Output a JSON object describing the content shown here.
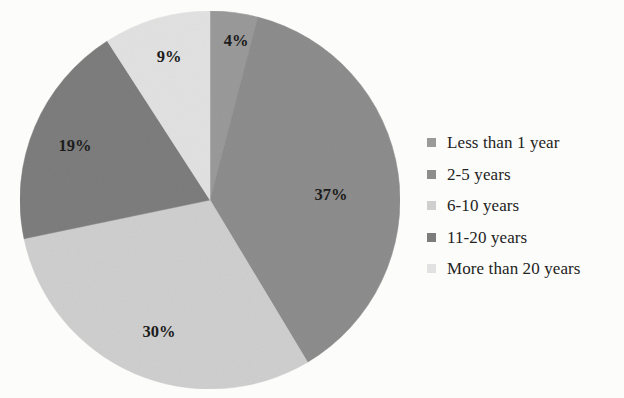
{
  "page": {
    "background_color": "#fcfcfa",
    "cropped_title_hint": ""
  },
  "chart_data": {
    "type": "pie",
    "title": "",
    "xlabel": "",
    "ylabel": "",
    "categories": [
      "Less than 1 year",
      "2-5 years",
      "6-10 years",
      "11-20 years",
      "More than 20 years"
    ],
    "values": [
      4,
      37,
      30,
      19,
      9
    ],
    "value_labels": [
      "4%",
      "37%",
      "30%",
      "19%",
      "9%"
    ],
    "units": "percent",
    "start_angle_deg": 0,
    "direction": "clockwise",
    "legend_position": "right",
    "grid": false,
    "colors": [
      "#9a9a9a",
      "#8d8d8d",
      "#cfcfcf",
      "#7d7d7d",
      "#e2e2e2"
    ],
    "slices": [
      {
        "label": "Less than 1 year",
        "value": 4,
        "display": "4%",
        "color": "#9a9a9a"
      },
      {
        "label": "2-5 years",
        "value": 37,
        "display": "37%",
        "color": "#8d8d8d"
      },
      {
        "label": "6-10 years",
        "value": 30,
        "display": "30%",
        "color": "#cfcfcf"
      },
      {
        "label": "11-20 years",
        "value": 19,
        "display": "19%",
        "color": "#7d7d7d"
      },
      {
        "label": "More than 20 years",
        "value": 9,
        "display": "9%",
        "color": "#e2e2e2"
      }
    ]
  },
  "pie": {
    "labels": {
      "s0": "4%",
      "s1": "37%",
      "s2": "30%",
      "s3": "19%",
      "s4": "9%"
    }
  },
  "legend": {
    "items": [
      {
        "label": "Less than 1 year",
        "color": "#9a9a9a"
      },
      {
        "label": "2-5 years",
        "color": "#8d8d8d"
      },
      {
        "label": "6-10 years",
        "color": "#cfcfcf"
      },
      {
        "label": "11-20 years",
        "color": "#7d7d7d"
      },
      {
        "label": "More than 20 years",
        "color": "#e2e2e2"
      }
    ]
  }
}
